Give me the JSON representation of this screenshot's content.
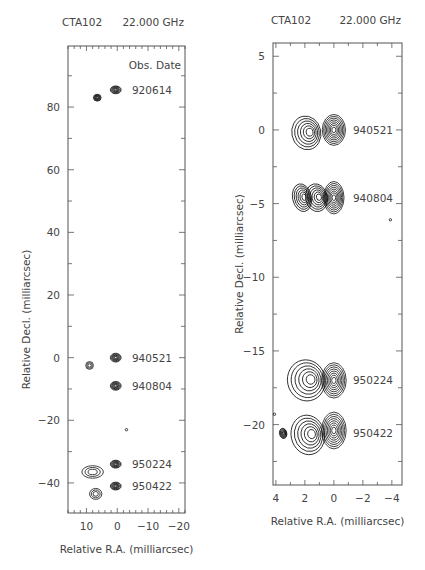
{
  "chart_data": [
    {
      "type": "contour",
      "title_left": "CTA102",
      "title_right": "22.000 GHz",
      "xlabel": "Relative R.A. (milliarcsec)",
      "ylabel": "Relative Decl. (milliarcsec)",
      "legend_header": "Obs. Date",
      "xlim": [
        16,
        -22
      ],
      "ylim": [
        -49.6,
        99.5
      ],
      "xticks": [
        10,
        0,
        -10,
        -20
      ],
      "yticks": [
        80,
        60,
        40,
        20,
        0,
        -20,
        -40
      ],
      "epochs": [
        {
          "label": "920614",
          "label_y": 85.5,
          "components": [
            {
              "ra": 0.5,
              "dec": 85.5,
              "w": 3.5,
              "h": 2.5,
              "filled": true
            },
            {
              "ra": 6.5,
              "dec": 83,
              "w": 2.5,
              "h": 2.2,
              "filled": true
            }
          ]
        },
        {
          "label": "940521",
          "label_y": 0,
          "components": [
            {
              "ra": 0.5,
              "dec": 0,
              "w": 3.5,
              "h": 2.8,
              "filled": true
            },
            {
              "ra": 9,
              "dec": -2.5,
              "w": 2.5,
              "h": 2.5,
              "filled": false
            }
          ]
        },
        {
          "label": "940804",
          "label_y": -9,
          "components": [
            {
              "ra": 0.5,
              "dec": -9,
              "w": 3.5,
              "h": 2.8,
              "filled": true
            }
          ]
        },
        {
          "label": "950224",
          "label_y": -34,
          "components": [
            {
              "ra": 0.5,
              "dec": -34,
              "w": 3.5,
              "h": 2.5,
              "filled": true
            },
            {
              "ra": 8,
              "dec": -36.5,
              "w": 7,
              "h": 4,
              "filled": false
            }
          ]
        },
        {
          "label": "950422",
          "label_y": -41,
          "components": [
            {
              "ra": 0.5,
              "dec": -41,
              "w": 3.5,
              "h": 2.5,
              "filled": true
            },
            {
              "ra": 7,
              "dec": -43.5,
              "w": 4,
              "h": 3.5,
              "filled": false
            }
          ]
        }
      ],
      "extra_points": [
        {
          "ra": -3,
          "dec": -23
        }
      ]
    },
    {
      "type": "contour",
      "title_left": "CTA102",
      "title_right": "22.000 GHz",
      "xlabel": "Relative R.A. (milliarcsec)",
      "ylabel": "Relative Decl. (milliarcsec)",
      "xlim": [
        4.2,
        -4.7
      ],
      "ylim": [
        -24.1,
        5.9
      ],
      "xticks": [
        4,
        2,
        0,
        -2,
        -4
      ],
      "yticks": [
        5,
        0,
        -5,
        -10,
        -15,
        -20
      ],
      "epochs": [
        {
          "label": "940521",
          "label_y": 0,
          "components": [
            {
              "ra": 0,
              "dec": 0,
              "w": 1.6,
              "h": 2.1,
              "core": true
            },
            {
              "ra": 1.9,
              "dec": -0.2,
              "w": 2.0,
              "h": 2.3,
              "core": false
            }
          ]
        },
        {
          "label": "940804",
          "label_y": -4.6,
          "components": [
            {
              "ra": 0,
              "dec": -4.6,
              "w": 1.4,
              "h": 2.2,
              "core": true
            },
            {
              "ra": 1.2,
              "dec": -4.6,
              "w": 1.5,
              "h": 1.9,
              "core": false
            },
            {
              "ra": 2.2,
              "dec": -4.6,
              "w": 1.3,
              "h": 1.9,
              "core": false
            }
          ]
        },
        {
          "label": "950224",
          "label_y": -17.0,
          "components": [
            {
              "ra": 0,
              "dec": -17.0,
              "w": 1.7,
              "h": 2.4,
              "core": true
            },
            {
              "ra": 1.9,
              "dec": -17.0,
              "w": 2.6,
              "h": 2.8,
              "core": false
            }
          ]
        },
        {
          "label": "950422",
          "label_y": -20.6,
          "components": [
            {
              "ra": 0,
              "dec": -20.4,
              "w": 1.7,
              "h": 2.5,
              "core": true
            },
            {
              "ra": 1.8,
              "dec": -20.7,
              "w": 2.3,
              "h": 2.7,
              "core": false
            },
            {
              "ra": 3.5,
              "dec": -20.6,
              "w": 0.5,
              "h": 0.7,
              "core": false
            }
          ]
        }
      ],
      "extra_points": [
        {
          "ra": -3.9,
          "dec": -6.1
        },
        {
          "ra": 4.1,
          "dec": -19.3
        }
      ]
    }
  ],
  "panels": {
    "left": {
      "source": "CTA102",
      "freq": "22.000 GHz",
      "legend_header": "Obs. Date",
      "xlabel": "Relative R.A. (milliarcsec)",
      "ylabel": "Relative Decl. (milliarcsec)"
    },
    "right": {
      "source": "CTA102",
      "freq": "22.000 GHz",
      "xlabel": "Relative R.A. (milliarcsec)",
      "ylabel": "Relative Decl. (milliarcsec)"
    }
  },
  "caption_fragment": ""
}
